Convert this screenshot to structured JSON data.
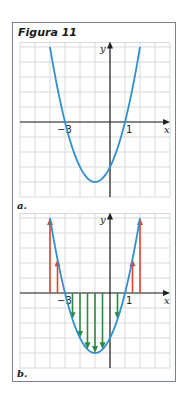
{
  "figure": {
    "title": "Figura 11",
    "panels": [
      {
        "label": "a."
      },
      {
        "label": "b."
      }
    ],
    "colors": {
      "frame": "#7a7f9a",
      "grid": "#d7d9dd",
      "axis": "#222222",
      "curve": "#2f8fcf",
      "positive_arrows": "#e0452b",
      "negative_arrows": "#2e8b3a"
    }
  },
  "chart_data": [
    {
      "type": "line",
      "panel": "a.",
      "title": "",
      "function": "y = (x + 3)(x - 1) = x^2 + 2x - 3",
      "xlabel": "x",
      "ylabel": "y",
      "xlim": [
        -6,
        4
      ],
      "ylim": [
        -5,
        5.3
      ],
      "grid": true,
      "x_tick_labels": [
        {
          "x": -3,
          "label": "−3"
        },
        {
          "x": 1,
          "label": "1"
        }
      ],
      "roots": [
        -3,
        1
      ],
      "vertex": [
        -1,
        -4
      ],
      "y_intercept": -3,
      "curve_domain": [
        -4,
        2
      ],
      "series": [
        {
          "name": "parabola",
          "x": [
            -4,
            -3.5,
            -3,
            -2.5,
            -2,
            -1.5,
            -1,
            -0.5,
            0,
            0.5,
            1,
            1.5,
            2
          ],
          "y": [
            5,
            2.25,
            0,
            -1.75,
            -3,
            -3.75,
            -4,
            -3.75,
            -3,
            -1.75,
            0,
            2.25,
            5
          ]
        }
      ]
    },
    {
      "type": "line",
      "panel": "b.",
      "title": "",
      "function": "y = x^2 + 2x - 3 with vertical arrows from x-axis to the curve",
      "xlabel": "x",
      "ylabel": "y",
      "xlim": [
        -6,
        4
      ],
      "ylim": [
        -5,
        5.3
      ],
      "grid": true,
      "x_tick_labels": [
        {
          "x": -3,
          "label": "−3"
        },
        {
          "x": 1,
          "label": "1"
        }
      ],
      "series": [
        {
          "name": "parabola",
          "x": [
            -4,
            -3.5,
            -3,
            -2.5,
            -2,
            -1.5,
            -1,
            -0.5,
            0,
            0.5,
            1,
            1.5,
            2
          ],
          "y": [
            5,
            2.25,
            0,
            -1.75,
            -3,
            -3.75,
            -4,
            -3.75,
            -3,
            -1.75,
            0,
            2.25,
            5
          ]
        },
        {
          "name": "positive arrows (red, pointing up)",
          "x": [
            -4,
            -3.5,
            1.5,
            2
          ],
          "y": [
            5,
            2.25,
            2.25,
            5
          ]
        },
        {
          "name": "negative arrows (green, pointing down)",
          "x": [
            -2.5,
            -2,
            -1.5,
            -1,
            -0.5,
            0.5
          ],
          "y": [
            -1.75,
            -3,
            -3.75,
            -4,
            -3.75,
            -1.75
          ]
        }
      ]
    }
  ]
}
